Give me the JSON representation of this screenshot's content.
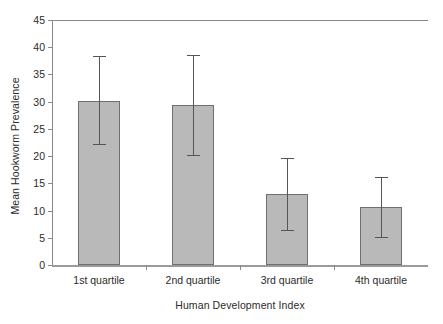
{
  "chart_data": {
    "type": "bar",
    "title": "",
    "xlabel": "Human Development Index",
    "ylabel": "Mean Hookworm Prevalence",
    "categories": [
      "1st quartile",
      "2nd quartile",
      "3rd quartile",
      "4th quartile"
    ],
    "values": [
      30.2,
      29.4,
      13.1,
      10.6
    ],
    "error_upper": [
      38.3,
      38.6,
      19.6,
      16.2
    ],
    "error_lower": [
      22.3,
      20.2,
      6.5,
      5.1
    ],
    "ylim": [
      0,
      45
    ],
    "yticks": [
      0,
      5,
      10,
      15,
      20,
      25,
      30,
      35,
      40,
      45
    ],
    "ytick_labels": [
      "0",
      "5",
      "10",
      "15",
      "20",
      "25",
      "30",
      "35",
      "40",
      "45"
    ],
    "grid": false,
    "legend": null,
    "bar_color": "#b9b9b9",
    "bar_edge_color": "#6f6f6f",
    "error_color": "#555555",
    "axis_color": "#8a8a8a",
    "background": "#ffffff"
  }
}
